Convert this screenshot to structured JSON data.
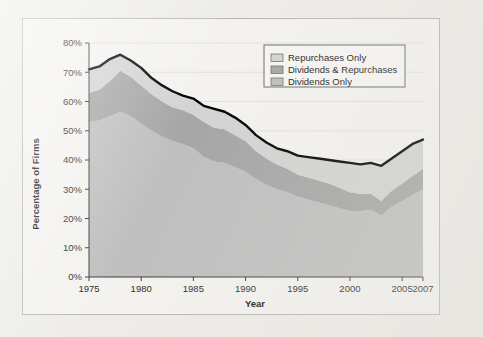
{
  "figure": {
    "background_color": "#f3f2ef",
    "page_color": "#edece8",
    "border_color": "#b9b8b4"
  },
  "chart_data": {
    "type": "area",
    "stacked": true,
    "title": "",
    "xlabel": "Year",
    "ylabel": "Percentage of Firms",
    "xlim": [
      1975,
      2007
    ],
    "ylim": [
      0,
      80
    ],
    "ytick_labels": [
      "0%",
      "10%",
      "20%",
      "30%",
      "40%",
      "50%",
      "60%",
      "70%",
      "80%"
    ],
    "ytick_values": [
      0,
      10,
      20,
      30,
      40,
      50,
      60,
      70,
      80
    ],
    "xtick_labels": [
      "1975",
      "1980",
      "1985",
      "1990",
      "1995",
      "2000",
      "2005",
      "2007"
    ],
    "xtick_values": [
      1975,
      1980,
      1985,
      1990,
      1995,
      2000,
      2005,
      2007
    ],
    "grid": true,
    "grid_color": "#dedcd6",
    "legend_position": "top-right",
    "x": [
      1975,
      1976,
      1977,
      1978,
      1979,
      1980,
      1981,
      1982,
      1983,
      1984,
      1985,
      1986,
      1987,
      1988,
      1989,
      1990,
      1991,
      1992,
      1993,
      1994,
      1995,
      1996,
      1997,
      1998,
      1999,
      2000,
      2001,
      2002,
      2003,
      2004,
      2005,
      2006,
      2007
    ],
    "series": [
      {
        "name": "Dividends Only",
        "color": "#bfbfbf",
        "values": [
          53.0,
          53.5,
          55.0,
          56.5,
          55.0,
          52.5,
          50.0,
          48.0,
          46.5,
          45.5,
          44.0,
          41.0,
          39.5,
          39.0,
          37.5,
          36.0,
          33.5,
          31.5,
          30.0,
          29.0,
          27.5,
          26.5,
          25.5,
          24.5,
          23.5,
          22.5,
          22.5,
          23.0,
          21.0,
          24.0,
          26.0,
          28.0,
          30.0
        ]
      },
      {
        "name": "Dividends & Repurchases",
        "color": "#a6a6a6",
        "values": [
          10.0,
          10.5,
          12.0,
          14.0,
          13.5,
          13.0,
          12.5,
          12.0,
          11.5,
          11.5,
          11.5,
          12.0,
          11.5,
          11.5,
          11.0,
          10.5,
          9.5,
          9.0,
          8.5,
          8.0,
          7.5,
          7.5,
          7.5,
          7.5,
          7.0,
          6.5,
          6.0,
          5.5,
          5.0,
          5.5,
          6.0,
          6.5,
          7.0
        ]
      },
      {
        "name": "Repurchases Only",
        "color": "#d3d3d3",
        "values": [
          8.0,
          8.0,
          7.5,
          5.5,
          5.5,
          6.0,
          5.5,
          5.5,
          5.5,
          5.0,
          5.5,
          5.5,
          6.5,
          6.0,
          6.0,
          5.5,
          5.5,
          5.5,
          5.5,
          6.0,
          6.5,
          7.0,
          7.5,
          8.0,
          9.0,
          10.0,
          10.0,
          10.5,
          12.0,
          11.0,
          11.0,
          11.0,
          10.0
        ]
      }
    ],
    "total_line": {
      "name": "Total",
      "color": "#000000",
      "width": 2.4,
      "values": [
        71.0,
        72.0,
        74.5,
        76.0,
        74.0,
        71.5,
        68.0,
        65.5,
        63.5,
        62.0,
        61.0,
        58.5,
        57.5,
        56.5,
        54.5,
        52.0,
        48.5,
        46.0,
        44.0,
        43.0,
        41.5,
        41.0,
        40.5,
        40.0,
        39.5,
        39.0,
        38.5,
        39.0,
        38.0,
        40.5,
        43.0,
        45.5,
        47.0
      ]
    },
    "legend": [
      {
        "label": "Repurchases Only",
        "color": "#d3d3d3"
      },
      {
        "label": "Dividends & Repurchases",
        "color": "#a6a6a6"
      },
      {
        "label": "Dividends Only",
        "color": "#bfbfbf"
      }
    ]
  }
}
